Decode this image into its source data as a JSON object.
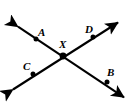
{
  "figure": {
    "type": "geometry-diagram",
    "width": 134,
    "height": 106,
    "background_color": "#ffffff",
    "stroke_color": "#000000",
    "label_color": "#000000"
  },
  "labels": {
    "a": "A",
    "b": "B",
    "c": "C",
    "d": "D",
    "x": "X"
  },
  "label_positions": {
    "a": {
      "x": 38,
      "y": 27
    },
    "b": {
      "x": 107,
      "y": 67
    },
    "c": {
      "x": 23,
      "y": 61
    },
    "d": {
      "x": 85,
      "y": 24
    },
    "x": {
      "x": 59,
      "y": 39
    }
  },
  "points": [
    {
      "name": "A",
      "x": 36,
      "y": 39,
      "on_line": "AB"
    },
    {
      "name": "X",
      "x": 63,
      "y": 56,
      "on_line": "both"
    },
    {
      "name": "B",
      "x": 107,
      "y": 82,
      "on_line": "AB"
    },
    {
      "name": "C",
      "x": 33,
      "y": 74,
      "on_line": "CD"
    },
    {
      "name": "D",
      "x": 93,
      "y": 37,
      "on_line": "CD"
    }
  ],
  "lines": [
    {
      "name": "line-AB",
      "through": [
        "A",
        "X",
        "B"
      ],
      "x1": 14,
      "y1": 24,
      "x2": 128,
      "y2": 100,
      "arrows": "both"
    },
    {
      "name": "line-CD",
      "through": [
        "C",
        "X",
        "D"
      ],
      "x1": 9,
      "y1": 92,
      "x2": 122,
      "y2": 20,
      "arrows": "both"
    }
  ]
}
